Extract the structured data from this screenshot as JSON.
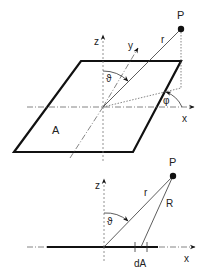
{
  "top_diagram": {
    "labels": {
      "point": "P",
      "radius": "r",
      "z_axis": "z",
      "y_axis": "y",
      "x_axis": "x",
      "theta": "ϑ",
      "phi": "φ",
      "area": "A"
    }
  },
  "bottom_diagram": {
    "labels": {
      "point": "P",
      "radius": "r",
      "distance": "R",
      "z_axis": "z",
      "x_axis": "x",
      "theta": "ϑ",
      "area_element": "dA"
    }
  },
  "colors": {
    "line": "#111111",
    "axis": "#666666",
    "background": "#ffffff"
  }
}
